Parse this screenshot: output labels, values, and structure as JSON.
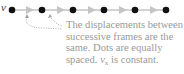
{
  "label": {
    "vector": "v⃗"
  },
  "caption": {
    "lines": [
      "The displacements between",
      "successive frames are the",
      "same. Dots are equally"
    ],
    "last_line_prefix": "spaced. ",
    "last_line_var": "v",
    "last_line_sub": "x",
    "last_line_suffix": " is constant."
  },
  "dots": {
    "count": 6,
    "x_positions": [
      12,
      42,
      73,
      104,
      135,
      166
    ],
    "y": 10
  },
  "colors": {
    "dot": "#111111",
    "arrow": "#b8b8b8",
    "caption": "#9a9a9a",
    "dotted_pointer": "#9a9a9a"
  }
}
